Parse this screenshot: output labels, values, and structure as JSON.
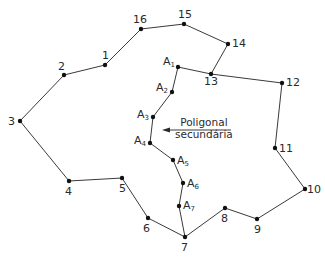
{
  "diagram": {
    "type": "traverse-polygon",
    "colors": {
      "line": "#3a3a3a",
      "point": "#111111",
      "text": "#2a2a2a",
      "background": "#ffffff"
    },
    "main_polygon": {
      "name": "Poligonal principal",
      "points": [
        {
          "label": "1",
          "x": 105,
          "y": 65
        },
        {
          "label": "2",
          "x": 64,
          "y": 75
        },
        {
          "label": "3",
          "x": 20,
          "y": 121
        },
        {
          "label": "4",
          "x": 69,
          "y": 181
        },
        {
          "label": "5",
          "x": 122,
          "y": 178
        },
        {
          "label": "6",
          "x": 148,
          "y": 218
        },
        {
          "label": "7",
          "x": 185,
          "y": 237
        },
        {
          "label": "8",
          "x": 225,
          "y": 208
        },
        {
          "label": "9",
          "x": 257,
          "y": 219
        },
        {
          "label": "10",
          "x": 305,
          "y": 189
        },
        {
          "label": "11",
          "x": 275,
          "y": 148
        },
        {
          "label": "12",
          "x": 282,
          "y": 83
        },
        {
          "label": "13",
          "x": 211,
          "y": 74
        },
        {
          "label": "14",
          "x": 228,
          "y": 44
        },
        {
          "label": "15",
          "x": 184,
          "y": 24
        },
        {
          "label": "16",
          "x": 141,
          "y": 29
        }
      ]
    },
    "secondary_polygon": {
      "name": "Poligonal secundária",
      "points": [
        {
          "label": "13",
          "x": 211,
          "y": 74
        },
        {
          "label": "A",
          "sub": "1",
          "x": 178,
          "y": 67
        },
        {
          "label": "A",
          "sub": "2",
          "x": 172,
          "y": 92
        },
        {
          "label": "A",
          "sub": "3",
          "x": 153,
          "y": 117
        },
        {
          "label": "A",
          "sub": "4",
          "x": 150,
          "y": 143
        },
        {
          "label": "A",
          "sub": "5",
          "x": 173,
          "y": 160
        },
        {
          "label": "A",
          "sub": "6",
          "x": 183,
          "y": 183
        },
        {
          "label": "A",
          "sub": "7",
          "x": 179,
          "y": 206
        },
        {
          "label": "7",
          "x": 185,
          "y": 237
        }
      ]
    },
    "annotation": {
      "line1": "Poligonal",
      "line2": "secundária",
      "arrow": {
        "from_x": 231,
        "from_y": 130,
        "to_x": 162,
        "to_y": 130
      }
    }
  }
}
